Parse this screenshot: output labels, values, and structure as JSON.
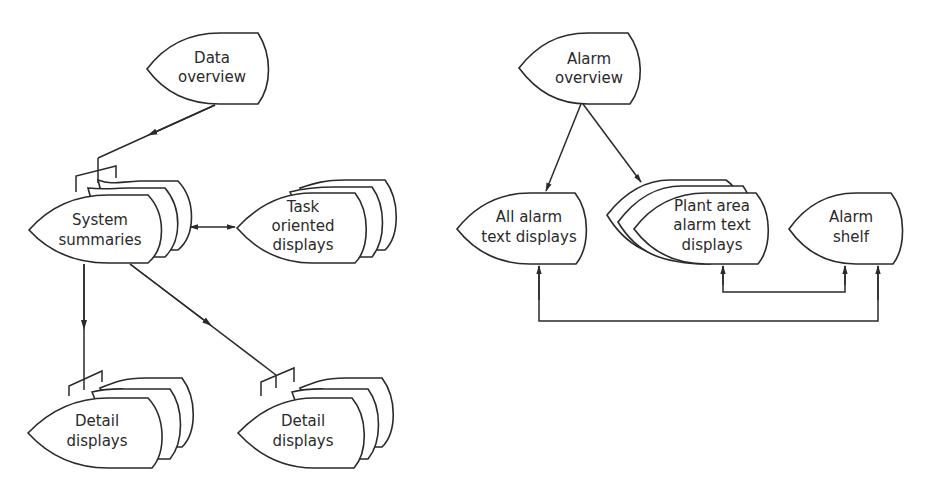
{
  "diagram": {
    "colors": {
      "stroke": "#2a2a2a",
      "background": "#ffffff"
    },
    "left_hierarchy": {
      "data_overview": {
        "line1": "Data",
        "line2": "overview"
      },
      "system_summaries": {
        "line1": "System",
        "line2": "summaries"
      },
      "task_oriented": {
        "line1": "Task",
        "line2": "oriented",
        "line3": "displays"
      },
      "detail_left": {
        "line1": "Detail",
        "line2": "displays"
      },
      "detail_right": {
        "line1": "Detail",
        "line2": "displays"
      }
    },
    "right_hierarchy": {
      "alarm_overview": {
        "line1": "Alarm",
        "line2": "overview"
      },
      "all_alarm": {
        "line1": "All alarm",
        "line2": "text displays"
      },
      "plant_area": {
        "line1": "Plant area",
        "line2": "alarm text",
        "line3": "displays"
      },
      "alarm_shelf": {
        "line1": "Alarm",
        "line2": "shelf"
      }
    },
    "connections": [
      "Data overview -> System summaries",
      "System summaries <-> Task oriented displays",
      "System summaries -> Detail displays (left)",
      "System summaries -> Detail displays (right)",
      "Alarm overview -> All alarm text displays",
      "Alarm overview -> Plant area alarm text displays",
      "Plant area alarm text displays <-> Alarm shelf",
      "All alarm text displays <-> Alarm shelf"
    ]
  }
}
